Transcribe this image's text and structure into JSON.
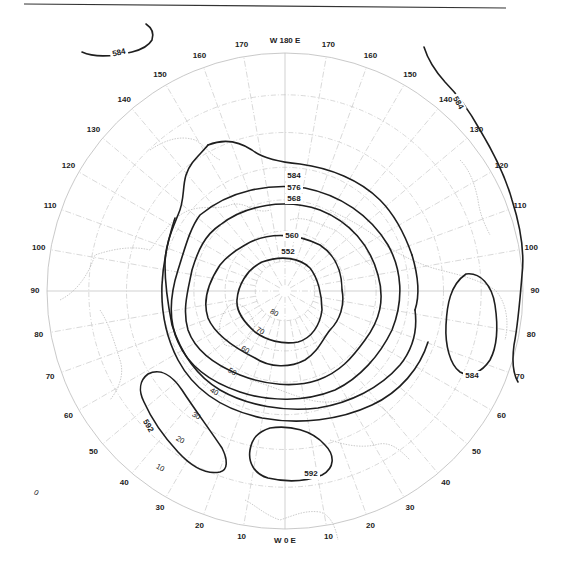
{
  "map": {
    "projection": "north polar stereographic",
    "top_label": "W 180 E",
    "bottom_label": "W 0 E",
    "longitude_labels_west": [
      "170",
      "160",
      "150",
      "140",
      "130",
      "120",
      "110",
      "100",
      "90",
      "80",
      "70",
      "60",
      "50",
      "40",
      "30",
      "20",
      "10"
    ],
    "longitude_labels_east": [
      "170",
      "160",
      "150",
      "140",
      "130",
      "120",
      "110",
      "100",
      "90",
      "80",
      "70",
      "60",
      "50",
      "40",
      "30",
      "20",
      "10"
    ],
    "longitude_values_west": [
      170,
      160,
      150,
      140,
      130,
      120,
      110,
      100,
      90,
      80,
      70,
      60,
      50,
      40,
      30,
      20,
      10
    ],
    "longitude_values_east": [
      170,
      160,
      150,
      140,
      130,
      120,
      110,
      100,
      90,
      80,
      70,
      60,
      50,
      40,
      30,
      20,
      10
    ],
    "latitude_circles": [
      80,
      70,
      60,
      50,
      40,
      30,
      20
    ],
    "latitude_labels": [
      {
        "text": "80",
        "lat": 80
      },
      {
        "text": "70",
        "lat": 70
      },
      {
        "text": "60",
        "lat": 60
      },
      {
        "text": "50",
        "lat": 50
      },
      {
        "text": "40",
        "lat": 40
      },
      {
        "text": "30",
        "lat": 30
      },
      {
        "text": "20",
        "lat": 20
      },
      {
        "text": "10",
        "lat": 10
      },
      {
        "text": "0",
        "lat": 0
      }
    ],
    "contour_units": "geopotential decameters",
    "contours": [
      {
        "value": 552,
        "label": "552"
      },
      {
        "value": 560,
        "label": "560"
      },
      {
        "value": 568,
        "label": "568"
      },
      {
        "value": 576,
        "label": "576"
      },
      {
        "value": 584,
        "label": "584"
      },
      {
        "value": 584,
        "label": "584",
        "region": "north-pacific-west"
      },
      {
        "value": 584,
        "label": "584",
        "region": "north-pacific-east"
      },
      {
        "value": 584,
        "label": "584",
        "region": "asia-closed"
      },
      {
        "value": 592,
        "label": "592",
        "region": "atlantic-closed"
      },
      {
        "value": 592,
        "label": "592",
        "region": "africa-closed"
      }
    ]
  }
}
